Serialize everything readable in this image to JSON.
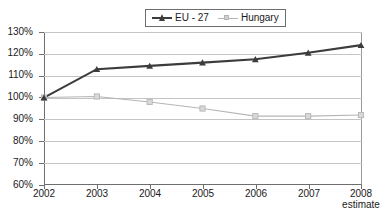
{
  "legend": {
    "position": "top-center",
    "entries": [
      {
        "label": "EU - 27",
        "color": "#3c3c3c",
        "marker": "triangle-marker"
      },
      {
        "label": "Hungary",
        "color": "#b5b5b5",
        "marker": "square-marker"
      }
    ]
  },
  "axes": {
    "y_ticks": [
      "130%",
      "120%",
      "110%",
      "100%",
      "90%",
      "80%",
      "70%",
      "60%"
    ],
    "x_ticks": [
      "2002",
      "2003",
      "2004",
      "2005",
      "2006",
      "2007",
      "2008"
    ],
    "x_note": "estimate",
    "x_note_at": "2008"
  },
  "chart_data": {
    "type": "line",
    "title": "",
    "subtitle": "",
    "xlabel": "",
    "ylabel": "",
    "categories": [
      "2002",
      "2003",
      "2004",
      "2005",
      "2006",
      "2007",
      "2008"
    ],
    "ylim": [
      60,
      130
    ],
    "ytick_values": [
      130,
      120,
      110,
      100,
      90,
      80,
      70,
      60
    ],
    "ytick_format": "percent",
    "grid": true,
    "legend_position": "top-center",
    "series": [
      {
        "name": "EU - 27",
        "color": "#3c3c3c",
        "marker": "triangle",
        "values": [
          100,
          113,
          114.5,
          116,
          117.5,
          120.5,
          124
        ]
      },
      {
        "name": "Hungary",
        "color": "#b5b5b5",
        "marker": "square",
        "values": [
          100,
          100.5,
          98,
          95,
          91.5,
          91.5,
          92
        ]
      }
    ]
  }
}
